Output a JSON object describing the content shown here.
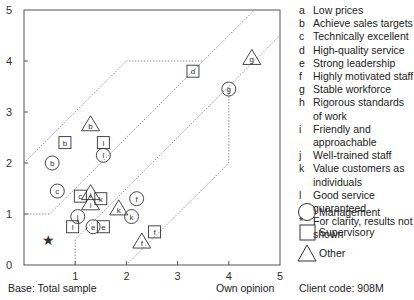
{
  "chart_data": {
    "type": "scatter",
    "title": "",
    "xlabel": "Own opinion",
    "ylabel": "",
    "xlim": [
      0,
      5
    ],
    "ylim": [
      0,
      5
    ],
    "xticks": [
      "1",
      "2",
      "3",
      "4",
      "5"
    ],
    "yticks": [
      "0",
      "1",
      "2",
      "3",
      "4",
      "5"
    ],
    "grid": false,
    "legend_position": "right",
    "series": [
      {
        "name": "Management",
        "marker": "circle",
        "points": [
          {
            "label": "b",
            "x": 0.55,
            "y": 2.0
          },
          {
            "label": "c",
            "x": 0.65,
            "y": 1.45
          },
          {
            "label": "e",
            "x": 1.35,
            "y": 0.75
          },
          {
            "label": "f",
            "x": 2.2,
            "y": 1.3
          },
          {
            "label": "g",
            "x": 4.0,
            "y": 3.45
          },
          {
            "label": "j",
            "x": 1.05,
            "y": 0.95
          },
          {
            "label": "k",
            "x": 2.1,
            "y": 0.95
          },
          {
            "label": "l",
            "x": 1.55,
            "y": 2.15
          }
        ]
      },
      {
        "name": "Supervisory",
        "marker": "square",
        "points": [
          {
            "label": "b",
            "x": 0.8,
            "y": 2.4
          },
          {
            "label": "c",
            "x": 1.1,
            "y": 1.35
          },
          {
            "label": "d",
            "x": 3.3,
            "y": 3.8
          },
          {
            "label": "e",
            "x": 1.55,
            "y": 0.75
          },
          {
            "label": "f",
            "x": 2.55,
            "y": 0.65
          },
          {
            "label": "k",
            "x": 1.5,
            "y": 1.3
          },
          {
            "label": "l",
            "x": 1.55,
            "y": 2.4
          },
          {
            "label": "l",
            "x": 0.95,
            "y": 0.75
          }
        ]
      },
      {
        "name": "Other",
        "marker": "triangle",
        "points": [
          {
            "label": "b",
            "x": 1.3,
            "y": 2.75
          },
          {
            "label": "f",
            "x": 2.3,
            "y": 0.45
          },
          {
            "label": "g",
            "x": 4.45,
            "y": 4.05
          },
          {
            "label": "i",
            "x": 1.3,
            "y": 1.2
          },
          {
            "label": "k",
            "x": 1.85,
            "y": 1.1
          },
          {
            "label": "l",
            "x": 1.3,
            "y": 1.4
          }
        ]
      },
      {
        "name": "For clarity, results not shown",
        "marker": "star",
        "points": [
          {
            "label": "*",
            "x": 0.47,
            "y": 0.5
          }
        ]
      }
    ],
    "boundary_lines": [
      {
        "name": "upper-outer",
        "points": [
          [
            0,
            2
          ],
          [
            2,
            4
          ],
          [
            3.5,
            4
          ]
        ]
      },
      {
        "name": "upper-inner",
        "points": [
          [
            0,
            1
          ],
          [
            0.5,
            1
          ],
          [
            4.5,
            5
          ]
        ]
      },
      {
        "name": "lower-inner",
        "points": [
          [
            1,
            0
          ],
          [
            1,
            0.5
          ],
          [
            5,
            4.5
          ]
        ]
      },
      {
        "name": "lower-outer",
        "points": [
          [
            2,
            0
          ],
          [
            4,
            2
          ],
          [
            4,
            3.5
          ]
        ]
      }
    ]
  },
  "legend": {
    "items": [
      {
        "key": "a",
        "text": "Low prices"
      },
      {
        "key": "b",
        "text": "Achieve sales targets"
      },
      {
        "key": "c",
        "text": "Technically excellent"
      },
      {
        "key": "d",
        "text": "High-quality service"
      },
      {
        "key": "e",
        "text": "Strong leadership"
      },
      {
        "key": "f",
        "text": "Highly motivated staff"
      },
      {
        "key": "g",
        "text": "Stable workforce"
      },
      {
        "key": "h",
        "text": "Rigorous standards of work"
      },
      {
        "key": "i",
        "text": "Friendly and approachable"
      },
      {
        "key": "j",
        "text": "Well-trained staff"
      },
      {
        "key": "k",
        "text": "Value customers as individuals"
      },
      {
        "key": "l",
        "text": "Good service guaranteed"
      },
      {
        "key": "*",
        "text": "For clarity, results not shown"
      }
    ],
    "shapes": [
      {
        "shape": "circle",
        "text": "Management"
      },
      {
        "shape": "square",
        "text": "Supervisory"
      },
      {
        "shape": "triangle",
        "text": "Other"
      }
    ]
  },
  "footer": {
    "base": "Base: Total sample",
    "xlabel": "Own opinion",
    "client_code": "Client code:  908M"
  }
}
